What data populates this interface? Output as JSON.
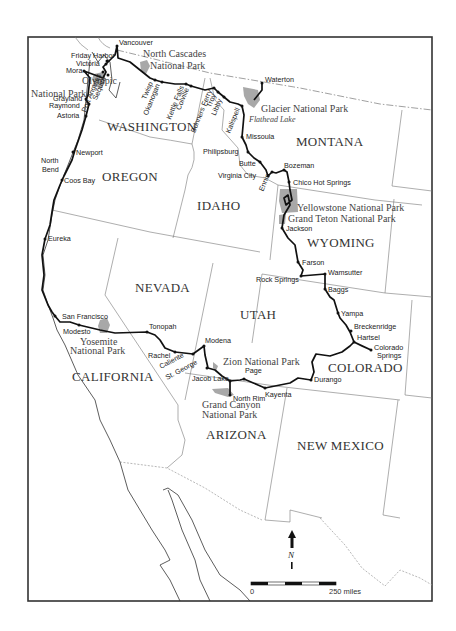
{
  "map": {
    "states": [
      {
        "name": "WASHINGTON",
        "x": 107,
        "y": 131
      },
      {
        "name": "OREGON",
        "x": 102,
        "y": 181
      },
      {
        "name": "IDAHO",
        "x": 197,
        "y": 210
      },
      {
        "name": "MONTANA",
        "x": 296,
        "y": 146
      },
      {
        "name": "WYOMING",
        "x": 307,
        "y": 247
      },
      {
        "name": "NEVADA",
        "x": 135,
        "y": 292
      },
      {
        "name": "UTAH",
        "x": 240,
        "y": 319
      },
      {
        "name": "COLORADO",
        "x": 328,
        "y": 372
      },
      {
        "name": "CALIFORNIA",
        "x": 72,
        "y": 381
      },
      {
        "name": "ARIZONA",
        "x": 206,
        "y": 439
      },
      {
        "name": "NEW MEXICO",
        "x": 297,
        "y": 450
      }
    ],
    "parks": [
      {
        "name": "olympic",
        "lines": [
          "Olympic",
          "National Park"
        ],
        "x": [
          82,
          31
        ],
        "y": [
          84,
          97
        ]
      },
      {
        "name": "north-cascades",
        "lines": [
          "North Cascades",
          "National Park"
        ],
        "x": [
          143,
          150
        ],
        "y": [
          57,
          69
        ]
      },
      {
        "name": "glacier",
        "lines": [
          "Glacier National Park"
        ],
        "x": [
          261
        ],
        "y": [
          112
        ]
      },
      {
        "name": "yellowstone",
        "lines": [
          "Yellowstone National Park"
        ],
        "x": [
          297
        ],
        "y": [
          211
        ]
      },
      {
        "name": "grand-teton",
        "lines": [
          "Grand Teton National Park"
        ],
        "x": [
          288
        ],
        "y": [
          222
        ]
      },
      {
        "name": "yosemite",
        "lines": [
          "Yosemite",
          "National Park"
        ],
        "x": [
          80,
          70
        ],
        "y": [
          345,
          354
        ]
      },
      {
        "name": "zion",
        "lines": [
          "Zion National Park"
        ],
        "x": [
          223
        ],
        "y": [
          365
        ]
      },
      {
        "name": "grand-canyon",
        "lines": [
          "Grand Canyon",
          "National Park"
        ],
        "x": [
          202,
          202
        ],
        "y": [
          408,
          418
        ]
      }
    ],
    "lake": {
      "name": "Flathead Lake",
      "x": 249,
      "y": 122
    },
    "cities": [
      {
        "name": "Vancouver",
        "x": 117,
        "y": 46,
        "dx": 2,
        "dy": -1,
        "rot": 0
      },
      {
        "name": "Friday Harbor",
        "x": 107,
        "y": 61,
        "dx": -36,
        "dy": -3,
        "rot": 0
      },
      {
        "name": "Victoria",
        "x": 106,
        "y": 64,
        "dx": -30,
        "dy": 2,
        "rot": 0
      },
      {
        "name": "Mora",
        "x": 84,
        "y": 71,
        "dx": -18,
        "dy": 2,
        "rot": 0
      },
      {
        "name": "Port Angeles",
        "x": 103,
        "y": 72,
        "dx": 0,
        "dy": 0,
        "rot": -68
      },
      {
        "name": "Sequim",
        "x": 108,
        "y": 75,
        "dx": 0,
        "dy": 0,
        "rot": -68
      },
      {
        "name": "Grayland",
        "x": 86,
        "y": 99,
        "dx": -33,
        "dy": 2,
        "rot": 0
      },
      {
        "name": "Raymond",
        "x": 89,
        "y": 104,
        "dx": -40,
        "dy": 4,
        "rot": 0
      },
      {
        "name": "Astoria",
        "x": 86,
        "y": 116,
        "dx": -29,
        "dy": 2,
        "rot": 0
      },
      {
        "name": "Twisp",
        "x": 155,
        "y": 80,
        "dx": 0,
        "dy": 0,
        "rot": -68
      },
      {
        "name": "Okanogan",
        "x": 162,
        "y": 82,
        "dx": 0,
        "dy": 0,
        "rot": -68
      },
      {
        "name": "Kettle Falls",
        "x": 186,
        "y": 84,
        "dx": 0,
        "dy": 0,
        "rot": -68
      },
      {
        "name": "Colville",
        "x": 191,
        "y": 86,
        "dx": 0,
        "dy": 0,
        "rot": -68
      },
      {
        "name": "Bonners Ferry",
        "x": 214,
        "y": 88,
        "dx": 0,
        "dy": 0,
        "rot": -68
      },
      {
        "name": "Troy",
        "x": 218,
        "y": 92,
        "dx": 0,
        "dy": 0,
        "rot": -68
      },
      {
        "name": "Libby",
        "x": 224,
        "y": 97,
        "dx": 0,
        "dy": 0,
        "rot": -68
      },
      {
        "name": "Kalispell",
        "x": 242,
        "y": 106,
        "dx": 0,
        "dy": 0,
        "rot": -68
      },
      {
        "name": "Waterton",
        "x": 262,
        "y": 83,
        "dx": 3,
        "dy": -1,
        "rot": 0
      },
      {
        "name": "Missoula",
        "x": 242,
        "y": 137,
        "dx": 4,
        "dy": 2,
        "rot": 0
      },
      {
        "name": "Philipsburg",
        "x": 248,
        "y": 152,
        "dx": -45,
        "dy": 2,
        "rot": 0
      },
      {
        "name": "Butte",
        "x": 260,
        "y": 162,
        "dx": -21,
        "dy": 4,
        "rot": 0
      },
      {
        "name": "Ennis",
        "x": 272,
        "y": 172,
        "dx": 0,
        "dy": 0,
        "rot": -68
      },
      {
        "name": "Virginia City",
        "x": 268,
        "y": 176,
        "dx": -50,
        "dy": 2,
        "rot": 0
      },
      {
        "name": "Bozeman",
        "x": 284,
        "y": 170,
        "dx": 0,
        "dy": -2,
        "rot": 0
      },
      {
        "name": "Chico Hot Springs",
        "x": 289,
        "y": 182,
        "dx": 4,
        "dy": 3,
        "rot": 0
      },
      {
        "name": "Jackson",
        "x": 282,
        "y": 228,
        "dx": 4,
        "dy": 3,
        "rot": 0
      },
      {
        "name": "Farson",
        "x": 298,
        "y": 262,
        "dx": 4,
        "dy": 3,
        "rot": 0
      },
      {
        "name": "Rock Springs",
        "x": 301,
        "y": 276,
        "dx": -45,
        "dy": 6,
        "rot": 0
      },
      {
        "name": "Wamsutter",
        "x": 325,
        "y": 274,
        "dx": 3,
        "dy": 1,
        "rot": 0
      },
      {
        "name": "Baggs",
        "x": 325,
        "y": 289,
        "dx": 3,
        "dy": 3,
        "rot": 0
      },
      {
        "name": "Yampa",
        "x": 338,
        "y": 313,
        "dx": 3,
        "dy": 3,
        "rot": 0
      },
      {
        "name": "Breckenridge",
        "x": 351,
        "y": 331,
        "dx": 3,
        "dy": -2,
        "rot": 0
      },
      {
        "name": "Hartsel",
        "x": 354,
        "y": 342,
        "dx": 3,
        "dy": -2,
        "rot": 0
      },
      {
        "name": "Colorado",
        "x": 371,
        "y": 350,
        "dx": 3,
        "dy": 0,
        "rot": 0
      },
      {
        "name": "Springs",
        "x": 371,
        "y": 350,
        "dx": 6,
        "dy": 8,
        "rot": 0,
        "nodot": true
      },
      {
        "name": "Durango",
        "x": 311,
        "y": 380,
        "dx": 3,
        "dy": 2,
        "rot": 0
      },
      {
        "name": "Kayenta",
        "x": 265,
        "y": 388,
        "dx": 0,
        "dy": 9,
        "rot": 0
      },
      {
        "name": "Page",
        "x": 244,
        "y": 379,
        "dx": 1,
        "dy": -6,
        "rot": 0
      },
      {
        "name": "North Rim",
        "x": 230,
        "y": 395,
        "dx": 3,
        "dy": 6,
        "rot": 0
      },
      {
        "name": "Jacob Lake",
        "x": 230,
        "y": 381,
        "dx": -38,
        "dy": 0,
        "rot": 0
      },
      {
        "name": "St. George",
        "x": 207,
        "y": 368,
        "dx": -38,
        "dy": 9,
        "rot": -28
      },
      {
        "name": "Modena",
        "x": 204,
        "y": 346,
        "dx": 1,
        "dy": -3,
        "rot": 0
      },
      {
        "name": "Caliente",
        "x": 193,
        "y": 354,
        "dx": -30,
        "dy": 12,
        "rot": -28
      },
      {
        "name": "Rachel",
        "x": 175,
        "y": 352,
        "dx": -27,
        "dy": 6,
        "rot": 0
      },
      {
        "name": "Tonopah",
        "x": 147,
        "y": 332,
        "dx": 2,
        "dy": -3,
        "rot": 0
      },
      {
        "name": "San Francisco",
        "x": 55,
        "y": 316,
        "dx": 7,
        "dy": 3,
        "rot": 0
      },
      {
        "name": "Modesto",
        "x": 79,
        "y": 325,
        "dx": -16,
        "dy": 9,
        "rot": 0
      },
      {
        "name": "Eureka",
        "x": 45,
        "y": 239,
        "dx": 3,
        "dy": 2,
        "rot": 0
      },
      {
        "name": "Coos Bay",
        "x": 62,
        "y": 180,
        "dx": 2,
        "dy": 3,
        "rot": 0
      },
      {
        "name": "North",
        "x": 41,
        "y": 163,
        "dx": 0,
        "dy": 0,
        "rot": 0,
        "nodot": true
      },
      {
        "name": "Bend",
        "x": 42,
        "y": 172,
        "dx": 0,
        "dy": 0,
        "rot": 0,
        "nodot": true
      },
      {
        "name": "Newport",
        "x": 73,
        "y": 152,
        "dx": 3,
        "dy": 3,
        "rot": 0
      }
    ]
  },
  "north_arrow": {
    "label": "N"
  },
  "scale_bar": {
    "start_label": "0",
    "end_label": "250 miles"
  }
}
